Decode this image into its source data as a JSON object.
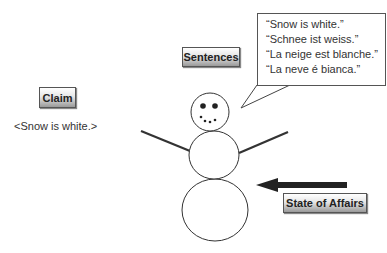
{
  "claim": {
    "label": "Claim",
    "proposition": "<Snow is white.>"
  },
  "sentences": {
    "label": "Sentences",
    "items": [
      "“Snow is white.”",
      "“Schnee ist weiss.”",
      "“La neige est blanche.”",
      "“La neve é bianca.”"
    ]
  },
  "state_of_affairs": {
    "label": "State of Affairs"
  },
  "colors": {
    "stroke": "#333333",
    "arrow": "#222222",
    "box_border": "#555555"
  }
}
